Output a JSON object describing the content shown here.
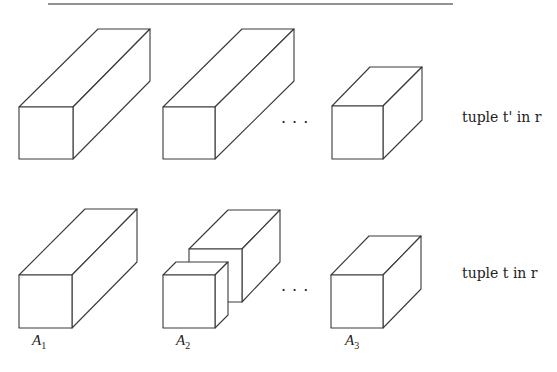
{
  "figure": {
    "rows": [
      {
        "label": "tuple t' in r",
        "ellipsis": "...",
        "cells": [
          {
            "shape": "long-box"
          },
          {
            "shape": "long-box"
          },
          {
            "shape": "short-box"
          }
        ]
      },
      {
        "label": "tuple t in r",
        "ellipsis": "...",
        "cells": [
          {
            "shape": "long-box",
            "attribute": "A",
            "subscript": "1"
          },
          {
            "shape": "split-box (small cube in front of box)",
            "attribute": "A",
            "subscript": "2"
          },
          {
            "shape": "short-box",
            "attribute": "A",
            "subscript": "3"
          }
        ]
      }
    ],
    "colors": {
      "line": "#3a3a3a",
      "rule": "#6e6e6e",
      "background": "#ffffff"
    }
  }
}
